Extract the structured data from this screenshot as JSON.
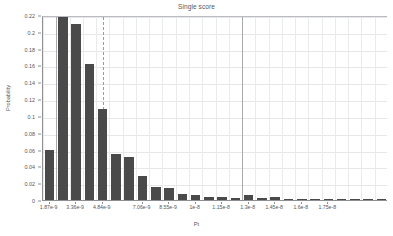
{
  "chart_data": {
    "type": "bar",
    "title": "Single score",
    "xlabel": "Pt",
    "ylabel": "Probability",
    "ylim": [
      0,
      0.22
    ],
    "yticks": [
      "0",
      "0.02",
      "0.04",
      "0.06",
      "0.08",
      "0.1",
      "0.12",
      "0.14",
      "0.16",
      "0.18",
      "0.2",
      "0.22"
    ],
    "ytick_values": [
      0,
      0.02,
      0.04,
      0.06,
      0.08,
      0.1,
      0.12,
      0.14,
      0.16,
      0.18,
      0.2,
      0.22
    ],
    "grid": true,
    "legend": null,
    "categories": [
      "1.87e-9",
      "2.61e-9",
      "3.36e-9",
      "4.10e-9",
      "4.84e-9",
      "5.58e-9",
      "6.32e-9",
      "7.06e-9",
      "7.80e-9",
      "8.55e-9",
      "9.29e-9",
      "1e-8",
      "1.07e-8",
      "1.15e-8",
      "1.22e-8",
      "1.3e-8",
      "1.37e-8",
      "1.45e-8",
      "1.52e-8",
      "1.6e-8",
      "1.67e-8",
      "1.75e-8",
      "1.82e-8",
      "1.9e-8",
      "1.97e-8",
      "2.05e-8"
    ],
    "values": [
      0.06,
      0.22,
      0.209,
      0.162,
      0.108,
      0.055,
      0.051,
      0.028,
      0.016,
      0.014,
      0.0075,
      0.006,
      0.003,
      0.0035,
      0.002,
      0.006,
      0.002,
      0.0035,
      0.0002,
      0.0012,
      0.0012,
      0.0012,
      0.0008,
      0.0006,
      0.0004,
      0.0003
    ],
    "xtick_labels": [
      "1.87e-9",
      "3.36e-9",
      "4.84e-9",
      "7.06e-9",
      "8.55e-9",
      "1e-8",
      "1.15e-8",
      "1.3e-8",
      "1.45e-8",
      "1.6e-8",
      "1.75e-8"
    ],
    "xtick_bar_index": [
      0,
      2,
      4,
      7,
      9,
      11,
      13,
      15,
      17,
      19,
      21
    ],
    "colors": {
      "bar": "#4a4a4a",
      "axis": "#8d8f92",
      "grid": "#e6e7e9",
      "text": "#55575a",
      "background": "#ffffff"
    }
  }
}
